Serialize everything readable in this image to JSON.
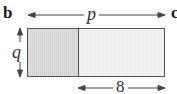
{
  "figure": {
    "part_label": "b",
    "next_part_label_partial": "c"
  },
  "dimensions": {
    "width_label": "p",
    "height_label": "q",
    "right_section_label": "8"
  },
  "rectangle": {
    "sections": [
      {
        "name": "left",
        "fill": "#d8d8d8"
      },
      {
        "name": "right",
        "fill": "#f1f1f1"
      }
    ],
    "border_color": "#555555"
  }
}
